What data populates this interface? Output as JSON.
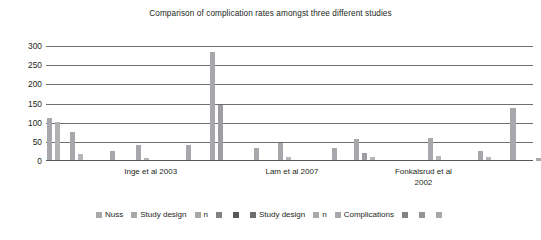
{
  "chart_data": {
    "type": "bar",
    "title": "Comparison of complication rates amongst three different studies",
    "xlabel": "",
    "ylabel": "",
    "ylim": [
      0,
      300
    ],
    "yticks": [
      0,
      50,
      100,
      150,
      200,
      250,
      300
    ],
    "grid": true,
    "legend_position": "bottom",
    "categories": [
      "Inge et al 2003",
      "Lam et al 2007",
      "Fonkalsrud et al 2002"
    ],
    "legend": [
      {
        "label": "Nuss",
        "color": "#a6a8ab"
      },
      {
        "label": "Study design",
        "color": "#a6a8ab"
      },
      {
        "label": "n",
        "color": "#a6a8ab"
      },
      {
        "label": "",
        "color": "#808285"
      },
      {
        "label": "",
        "color": "#58595b"
      },
      {
        "label": "Study design",
        "color": "#6d6e71"
      },
      {
        "label": "n",
        "color": "#a6a8ab"
      },
      {
        "label": "Complications",
        "color": "#a6a8ab"
      },
      {
        "label": "",
        "color": "#808285"
      },
      {
        "label": "",
        "color": "#929497"
      },
      {
        "label": "",
        "color": "#a6a8ab"
      }
    ],
    "bars": [
      {
        "x": 0.5,
        "value": 112,
        "width": 5.0,
        "color": "#a6a8ab"
      },
      {
        "x": 8.5,
        "value": 103,
        "width": 5.0,
        "color": "#b0b2b4"
      },
      {
        "x": 24.0,
        "value": 75,
        "width": 5.0,
        "color": "#a6a8ab"
      },
      {
        "x": 32.0,
        "value": 17,
        "width": 5.0,
        "color": "#b5b7b9"
      },
      {
        "x": 64.0,
        "value": 26,
        "width": 5.0,
        "color": "#a6a8ab"
      },
      {
        "x": 90.0,
        "value": 43,
        "width": 5.0,
        "color": "#a6a8ab"
      },
      {
        "x": 98.0,
        "value": 8,
        "width": 5.0,
        "color": "#b5b7b9"
      },
      {
        "x": 140.0,
        "value": 43,
        "width": 5.0,
        "color": "#a6a8ab"
      },
      {
        "x": 164.0,
        "value": 285,
        "width": 5.0,
        "color": "#a6a8ab"
      },
      {
        "x": 172.0,
        "value": 147,
        "width": 5.0,
        "color": "#9c9ea1"
      },
      {
        "x": 208.0,
        "value": 34,
        "width": 5.0,
        "color": "#a6a8ab"
      },
      {
        "x": 232.0,
        "value": 46,
        "width": 5.0,
        "color": "#a6a8ab"
      },
      {
        "x": 240.0,
        "value": 10,
        "width": 5.0,
        "color": "#b5b7b9"
      },
      {
        "x": 286.0,
        "value": 33,
        "width": 5.0,
        "color": "#a6a8ab"
      },
      {
        "x": 308.0,
        "value": 58,
        "width": 5.0,
        "color": "#a6a8ab"
      },
      {
        "x": 316.0,
        "value": 21,
        "width": 5.0,
        "color": "#9c9ea1"
      },
      {
        "x": 324.0,
        "value": 10,
        "width": 5.0,
        "color": "#b5b7b9"
      },
      {
        "x": 382.0,
        "value": 61,
        "width": 5.0,
        "color": "#a6a8ab"
      },
      {
        "x": 390.0,
        "value": 13,
        "width": 5.0,
        "color": "#b5b7b9"
      },
      {
        "x": 432.0,
        "value": 25,
        "width": 5.0,
        "color": "#a6a8ab"
      },
      {
        "x": 440.0,
        "value": 11,
        "width": 5.0,
        "color": "#b5b7b9"
      },
      {
        "x": 464.0,
        "value": 139,
        "width": 5.5,
        "color": "#a6a8ab"
      },
      {
        "x": 490.0,
        "value": 7,
        "width": 5.0,
        "color": "#a6a8ab"
      },
      {
        "x": 497.0,
        "value": 6,
        "width": 5.0,
        "color": "#b5b7b9"
      }
    ],
    "category_positions": [
      0.215,
      0.505,
      0.775
    ]
  }
}
